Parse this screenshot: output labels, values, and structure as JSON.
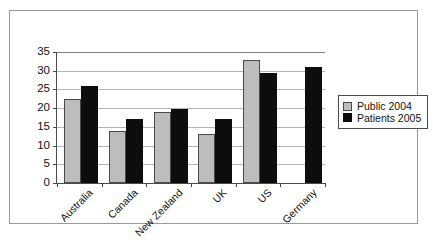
{
  "figure": {
    "frame_border_color": "#9a9a9a",
    "shadow_color": "#111111",
    "background": "#ffffff"
  },
  "legend": {
    "position": "right",
    "entries": [
      {
        "label": "Public 2004",
        "swatch": "legend-swatch-public",
        "color": "#bdbdbd"
      },
      {
        "label": "Patients 2005",
        "swatch": "legend-swatch-patients",
        "color": "#0d0d0d"
      }
    ]
  },
  "chart_data": {
    "type": "bar",
    "title": "",
    "subtitle": "",
    "xlabel": "",
    "ylabel": "",
    "categories": [
      "Australia",
      "Canada",
      "New Zealand",
      "UK",
      "US",
      "Germany"
    ],
    "series": [
      {
        "name": "Public 2004",
        "color": "#bdbdbd",
        "values": [
          22.5,
          14,
          19,
          13,
          33,
          null
        ]
      },
      {
        "name": "Patients 2005",
        "color": "#0d0d0d",
        "values": [
          26,
          17,
          19.7,
          17,
          29.5,
          31
        ]
      }
    ],
    "ylim": [
      0,
      35
    ],
    "yticks": [
      0,
      5,
      10,
      15,
      20,
      25,
      30,
      35
    ],
    "ytick_labels": [
      "0",
      "5",
      "10",
      "15",
      "20",
      "25",
      "30",
      "35"
    ],
    "grid": true,
    "grid_axis": "y",
    "legend_position": "right",
    "xtick_label_rotation": -45
  }
}
